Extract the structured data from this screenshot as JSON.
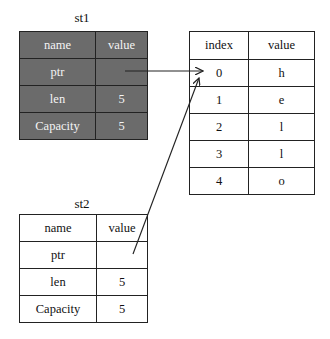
{
  "st1": {
    "title": "st1",
    "header": [
      "name",
      "value"
    ],
    "rows": [
      [
        "ptr",
        ""
      ],
      [
        "len",
        "5"
      ],
      [
        "Capacity",
        "5"
      ]
    ],
    "style": "shaded"
  },
  "st2": {
    "title": "st2",
    "header": [
      "name",
      "value"
    ],
    "rows": [
      [
        "ptr",
        ""
      ],
      [
        "len",
        "5"
      ],
      [
        "Capacity",
        "5"
      ]
    ],
    "style": "plain"
  },
  "heap": {
    "header": [
      "index",
      "value"
    ],
    "rows": [
      [
        "0",
        "h"
      ],
      [
        "1",
        "e"
      ],
      [
        "2",
        "l"
      ],
      [
        "3",
        "l"
      ],
      [
        "4",
        "o"
      ]
    ]
  },
  "arrows": [
    {
      "from": "st1.ptr",
      "to": "heap.index.0"
    },
    {
      "from": "st2.ptr",
      "to": "heap.index.0"
    }
  ],
  "colors": {
    "shaded_fill": "#6b6b6b",
    "shaded_text": "#f4f4f4",
    "border": "#222222"
  }
}
